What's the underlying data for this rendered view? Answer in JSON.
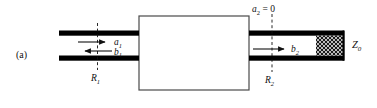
{
  "figure": {
    "panel_label": "(a)",
    "background_color": "#ffffff",
    "ink_color": "#111111",
    "conductor_color": "#000000"
  },
  "network": {
    "box_label": "",
    "box_fill": "#ffffff",
    "box_stroke": "#444444"
  },
  "port1": {
    "incident_wave_label": "a",
    "incident_wave_sub": "1",
    "reflected_wave_label": "b",
    "reflected_wave_sub": "1",
    "reference_plane_label": "R",
    "reference_plane_sub": "1",
    "incident_direction": "right",
    "reflected_direction": "left"
  },
  "port2": {
    "incident_wave_expression": "a",
    "incident_wave_sub": "2",
    "incident_wave_value": "= 0",
    "emergent_wave_label": "b",
    "emergent_wave_sub": "2",
    "reference_plane_label": "R",
    "reference_plane_sub": "2",
    "emergent_direction": "right",
    "termination_label": "Z",
    "termination_sub": "0",
    "termination_style": "hatched-matched-load"
  }
}
